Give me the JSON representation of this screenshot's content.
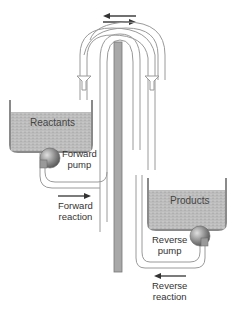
{
  "diagram": {
    "type": "pump-flow-equilibrium",
    "labels": {
      "reactants": "Reactants",
      "products": "Products",
      "forward_pump_line1": "Forward",
      "forward_pump_line2": "pump",
      "reverse_pump_line1": "Reverse",
      "reverse_pump_line2": "pump",
      "forward_reaction_line1": "Forward",
      "forward_reaction_line2": "reaction",
      "reverse_reaction_line1": "Reverse",
      "reverse_reaction_line2": "reaction"
    },
    "icons": {
      "top_arrows": "bidirectional-arrows-icon",
      "forward_arrow": "right-arrow-icon",
      "reverse_arrow": "left-arrow-icon",
      "pump": "pump-icon"
    },
    "colors": {
      "liquid": "#b9b9b9",
      "tank_wall": "#8a8a8a",
      "center_bar": "#a8a8a8",
      "pipe": "#9a9a9a",
      "arrow": "#333333",
      "text": "#333333"
    }
  }
}
